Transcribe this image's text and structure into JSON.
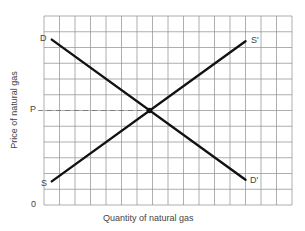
{
  "chart_data": {
    "type": "line",
    "title": "",
    "xlabel": "Quantity of natural gas",
    "ylabel": "Price of natural gas",
    "origin_label": "0",
    "grid": true,
    "grid_cols": 16,
    "grid_rows": 12,
    "xlim": [
      0,
      16
    ],
    "ylim": [
      0,
      12
    ],
    "series": [
      {
        "name": "Demand",
        "start_label": "D",
        "end_label": "D'",
        "points": [
          [
            0.5,
            10.5
          ],
          [
            13,
            1.6
          ]
        ]
      },
      {
        "name": "Supply",
        "start_label": "S",
        "end_label": "S'",
        "points": [
          [
            0.5,
            1.5
          ],
          [
            13,
            10.4
          ]
        ]
      }
    ],
    "equilibrium": {
      "x": 6.8,
      "y": 6.0,
      "price_label": "P",
      "price_guide": "dashed"
    },
    "colors": {
      "grid": "#9a9a9a",
      "curves": "#111111",
      "dashed": "#777777",
      "text": "#444444"
    }
  },
  "labels": {
    "d": "D",
    "d_prime": "D'",
    "s": "S",
    "s_prime": "S'",
    "p": "P",
    "zero": "0",
    "x_axis": "Quantity of natural gas",
    "y_axis": "Price of natural gas"
  }
}
